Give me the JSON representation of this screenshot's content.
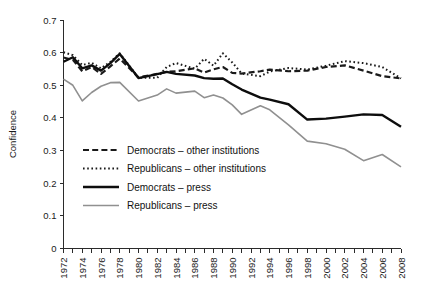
{
  "chart_data": {
    "type": "line",
    "title": "",
    "xlabel": "",
    "ylabel": "Confidence",
    "xlim": [
      1972,
      2008
    ],
    "ylim": [
      0,
      0.7
    ],
    "grid": false,
    "legend_position": "center-left-inside",
    "y_ticks": [
      "0",
      "0.1",
      "0.2",
      "0.3",
      "0.4",
      "0.5",
      "0.6",
      "0.7"
    ],
    "y_tick_values": [
      0,
      0.1,
      0.2,
      0.3,
      0.4,
      0.5,
      0.6,
      0.7
    ],
    "x_ticks": [
      "1972",
      "1974",
      "1976",
      "1978",
      "1980",
      "1982",
      "1984",
      "1986",
      "1988",
      "1990",
      "1992",
      "1994",
      "1996",
      "1998",
      "2000",
      "2002",
      "2004",
      "2006",
      "2008"
    ],
    "x_tick_values": [
      1972,
      1974,
      1976,
      1978,
      1980,
      1982,
      1984,
      1986,
      1988,
      1990,
      1992,
      1994,
      1996,
      1998,
      2000,
      2002,
      2004,
      2006,
      2008
    ],
    "x": [
      1972,
      1973,
      1974,
      1975,
      1976,
      1977,
      1978,
      1980,
      1982,
      1983,
      1984,
      1986,
      1987,
      1988,
      1989,
      1990,
      1991,
      1993,
      1994,
      1996,
      1998,
      2000,
      2002,
      2004,
      2006,
      2008
    ],
    "series": [
      {
        "name": "Democrats – other institutions",
        "color": "#1a1a1a",
        "style": "dashed",
        "width": 2.2,
        "values": [
          0.585,
          0.578,
          0.543,
          0.556,
          0.535,
          0.558,
          0.582,
          0.524,
          0.535,
          0.541,
          0.543,
          0.552,
          0.539,
          0.549,
          0.556,
          0.538,
          0.536,
          0.543,
          0.548,
          0.543,
          0.545,
          0.556,
          0.561,
          0.545,
          0.528,
          0.521
        ]
      },
      {
        "name": "Republicans – other institutions",
        "color": "#1a1a1a",
        "style": "dotted",
        "width": 2.0,
        "values": [
          0.601,
          0.592,
          0.562,
          0.569,
          0.552,
          0.572,
          0.598,
          0.523,
          0.523,
          0.556,
          0.568,
          0.551,
          0.581,
          0.56,
          0.598,
          0.57,
          0.536,
          0.528,
          0.542,
          0.553,
          0.548,
          0.56,
          0.574,
          0.568,
          0.556,
          0.521
        ]
      },
      {
        "name": "Democrats – press",
        "color": "#0d0d0d",
        "style": "solid",
        "width": 2.4,
        "values": [
          0.572,
          0.586,
          0.552,
          0.561,
          0.545,
          0.568,
          0.596,
          0.522,
          0.534,
          0.541,
          0.535,
          0.53,
          0.522,
          0.52,
          0.521,
          0.503,
          0.487,
          0.462,
          0.456,
          0.442,
          0.395,
          0.398,
          0.404,
          0.411,
          0.409,
          0.373
        ]
      },
      {
        "name": "Republicans – press",
        "color": "#909090",
        "style": "solid",
        "width": 1.6,
        "values": [
          0.519,
          0.5,
          0.452,
          0.478,
          0.497,
          0.508,
          0.509,
          0.452,
          0.47,
          0.489,
          0.476,
          0.482,
          0.462,
          0.47,
          0.461,
          0.44,
          0.411,
          0.437,
          0.425,
          0.379,
          0.329,
          0.321,
          0.304,
          0.269,
          0.288,
          0.25
        ]
      }
    ]
  },
  "legend": {
    "items": [
      {
        "label": "Democrats – other institutions",
        "swatch": "dashed-black"
      },
      {
        "label": "Republicans – other institutions",
        "swatch": "dotted-black"
      },
      {
        "label": "Democrats – press",
        "swatch": "solid-black"
      },
      {
        "label": "Republicans – press",
        "swatch": "solid-gray"
      }
    ]
  },
  "colors": {
    "axis": "#2b2b2b",
    "black_series": "#1a1a1a",
    "gray_series": "#909090",
    "background": "#ffffff"
  }
}
